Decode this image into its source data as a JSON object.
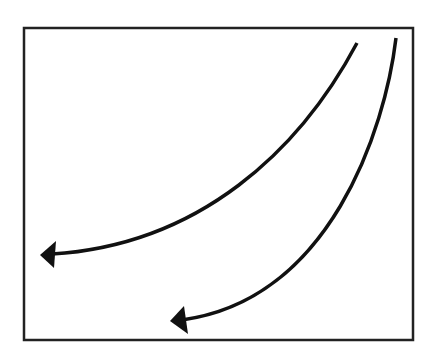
{
  "diagram": {
    "background": "#ffffff",
    "stroke_color": "#111111",
    "frame": {
      "x": 24,
      "y": 28,
      "width": 389,
      "height": 312
    },
    "arrows": [
      {
        "name": "upper-curved-arrow",
        "path": "M357,43 C300,150 200,245 52,254",
        "head": "40,255 56,241 54,268"
      },
      {
        "name": "lower-curved-arrow",
        "path": "M396,38 C385,130 330,300 182,320",
        "head": "170,321 184,306 188,334"
      }
    ]
  }
}
